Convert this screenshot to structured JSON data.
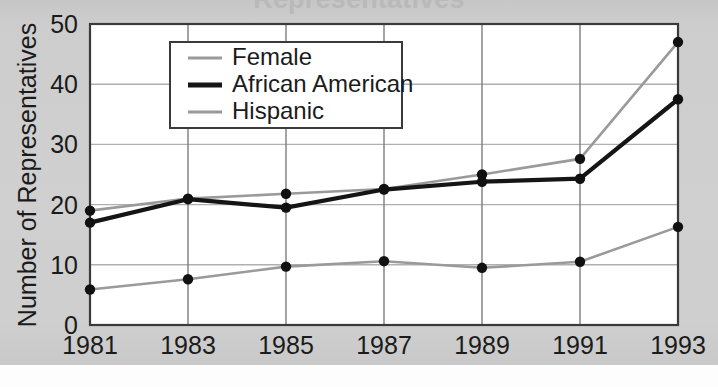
{
  "figure": {
    "title": "Representatives",
    "page_background": "#cbcbcb",
    "plot_background": "#ffffff"
  },
  "chart_data": {
    "type": "line",
    "title": "Representatives",
    "xlabel": "",
    "ylabel": "Number of Representatives",
    "x": [
      1981,
      1983,
      1985,
      1987,
      1989,
      1991,
      1993
    ],
    "categories": [
      "1981",
      "1983",
      "1985",
      "1987",
      "1989",
      "1991",
      "1993"
    ],
    "xlim": [
      1981,
      1993
    ],
    "ylim": [
      0,
      50
    ],
    "yticks": [
      0,
      10,
      20,
      30,
      40,
      50
    ],
    "ytick_labels": [
      "0",
      "10",
      "20",
      "30",
      "40",
      "50"
    ],
    "xticks": [
      1981,
      1983,
      1985,
      1987,
      1989,
      1991,
      1993
    ],
    "xtick_labels": [
      "1981",
      "1983",
      "1985",
      "1987",
      "1989",
      "1991",
      "1993"
    ],
    "grid": true,
    "grid_color": "#b0b0b0",
    "legend_position": "upper left",
    "markers": "filled-circle",
    "series": [
      {
        "name": "Female",
        "color": "#9a9a9a",
        "line_width": 2.6,
        "values": [
          19.0,
          21.0,
          21.8,
          22.6,
          25.0,
          27.6,
          47.0
        ]
      },
      {
        "name": "African American",
        "color": "#151515",
        "line_width": 4.2,
        "values": [
          17.0,
          20.9,
          19.5,
          22.5,
          23.8,
          24.3,
          37.5
        ]
      },
      {
        "name": "Hispanic",
        "color": "#9a9a9a",
        "line_width": 2.6,
        "values": [
          5.9,
          7.6,
          9.7,
          10.6,
          9.5,
          10.5,
          16.3
        ]
      }
    ]
  },
  "legend": {
    "entries": [
      {
        "label": "Female",
        "color": "#9a9a9a",
        "thickness": 3
      },
      {
        "label": "African American",
        "color": "#151515",
        "thickness": 5
      },
      {
        "label": "Hispanic",
        "color": "#9a9a9a",
        "thickness": 3
      }
    ]
  }
}
